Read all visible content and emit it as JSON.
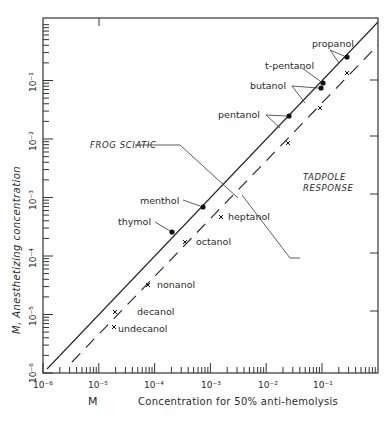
{
  "chart_data": {
    "type": "scatter",
    "title": "",
    "xlabel": "Concentration for 50% anti-hemolysis",
    "xlabel_unit": "M",
    "ylabel": "Anesthetizing concentration",
    "ylabel_unit": "M",
    "xscale": "log",
    "yscale": "log",
    "xlim": [
      1e-06,
      1
    ],
    "ylim": [
      1e-06,
      1
    ],
    "x_tick_labels": [
      "10⁻⁶",
      "10⁻⁵",
      "10⁻⁴",
      "10⁻³",
      "10⁻²",
      "10⁻¹"
    ],
    "y_tick_labels": [
      "10⁻⁶",
      "10⁻⁵",
      "10⁻⁴",
      "10⁻³",
      "10⁻²",
      "10⁻¹"
    ],
    "grid": false,
    "lines": [
      {
        "name": "FROG SCIATIC",
        "style": "solid",
        "points": [
          [
            1.2e-06,
            1.2e-06
          ],
          [
            1,
            1
          ]
        ]
      },
      {
        "name": "TADPOLE RESPONSE",
        "style": "dashed",
        "points": [
          [
            3.2e-06,
            1.5e-06
          ],
          [
            1,
            0.33
          ]
        ]
      }
    ],
    "series": [
      {
        "name": "Frog sciatic",
        "marker": "dot",
        "points": [
          {
            "label": "propanol",
            "x": 0.27,
            "y": 0.25
          },
          {
            "label": "t-pentanol",
            "x": 0.1,
            "y": 0.09
          },
          {
            "label": "butanol",
            "x": 0.09,
            "y": 0.074
          },
          {
            "label": "pentanol",
            "x": 0.025,
            "y": 0.025
          },
          {
            "label": "menthol",
            "x": 0.00072,
            "y": 0.00069
          },
          {
            "label": "thymol",
            "x": 0.0002,
            "y": 0.00026
          }
        ]
      },
      {
        "name": "Tadpole response",
        "marker": "x",
        "points": [
          {
            "label": "propanol",
            "x": 0.27,
            "y": 0.13
          },
          {
            "label": "butanol",
            "x": 0.09,
            "y": 0.034
          },
          {
            "label": "pentanol",
            "x": 0.024,
            "y": 0.0085
          },
          {
            "label": "heptanol",
            "x": 0.0015,
            "y": 0.00047
          },
          {
            "label": "octanol",
            "x": 0.00035,
            "y": 0.00017
          },
          {
            "label": "nonanol",
            "x": 7.5e-05,
            "y": 3.2e-05
          },
          {
            "label": "decanol",
            "x": 1.9e-05,
            "y": 1.1e-05
          },
          {
            "label": "undecanol",
            "x": 1.9e-05,
            "y": 6.2e-06
          }
        ]
      }
    ],
    "annotations": [
      {
        "text": "propanol"
      },
      {
        "text": "t-pentanol"
      },
      {
        "text": "butanol"
      },
      {
        "text": "pentanol"
      },
      {
        "text": "menthol"
      },
      {
        "text": "thymol"
      },
      {
        "text": "heptanol"
      },
      {
        "text": "octanol"
      },
      {
        "text": "nonanol"
      },
      {
        "text": "decanol"
      },
      {
        "text": "undecanol"
      },
      {
        "text": "FROG SCIATIC"
      },
      {
        "text": "TADPOLE RESPONSE"
      }
    ]
  },
  "labels": {
    "x_unit": "M",
    "x_title": "Concentration for 50% anti-hemolysis",
    "y_title": "M,  Anesthetizing concentration",
    "frog": "FROG SCIATIC",
    "tadpole_1": "TADPOLE",
    "tadpole_2": "RESPONSE",
    "propanol": "propanol",
    "tpentanol": "t-pentanol",
    "butanol": "butanol",
    "pentanol": "pentanol",
    "menthol": "menthol",
    "thymol": "thymol",
    "heptanol": "heptanol",
    "octanol": "octanol",
    "nonanol": "nonanol",
    "decanol": "decanol",
    "undecanol": "undecanol",
    "xt0": "10⁻⁶",
    "xt1": "10⁻⁵",
    "xt2": "10⁻⁴",
    "xt3": "10⁻³",
    "xt4": "10⁻²",
    "xt5": "10⁻¹",
    "yt0": "10⁻⁶",
    "yt1": "10⁻⁵",
    "yt2": "10⁻⁴",
    "yt3": "10⁻³",
    "yt4": "10⁻²",
    "yt5": "10⁻¹"
  }
}
